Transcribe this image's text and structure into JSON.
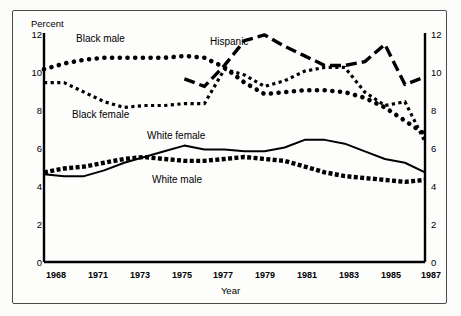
{
  "figure": {
    "y_axis_title": "Percent",
    "x_axis_title": "Year"
  },
  "chart_data": {
    "type": "line",
    "title": "",
    "subtitle": "",
    "xlabel": "Year",
    "ylabel": "Percent",
    "xlim": [
      1968,
      1987
    ],
    "ylim": [
      0,
      12
    ],
    "ytick_labels_left": [
      "12",
      "10",
      "8",
      "6",
      "4",
      "2",
      "0"
    ],
    "ytick_labels_right": [
      "12",
      "10",
      "8",
      "6",
      "4",
      "2",
      "0"
    ],
    "yticks": [
      12,
      10,
      8,
      6,
      4,
      2,
      0
    ],
    "xtick_labels": [
      "1968",
      "1971",
      "1973",
      "1975",
      "1977",
      "1979",
      "1981",
      "1983",
      "1985",
      "1987"
    ],
    "xticks": [
      1968,
      1971,
      1973,
      1975,
      1977,
      1979,
      1981,
      1983,
      1985,
      1987
    ],
    "grid": false,
    "legend_position": "inline-annotations",
    "x": [
      1968,
      1969,
      1970,
      1971,
      1972,
      1973,
      1974,
      1975,
      1976,
      1977,
      1978,
      1979,
      1980,
      1981,
      1982,
      1983,
      1984,
      1985,
      1986,
      1987
    ],
    "series": [
      {
        "name": "Black male",
        "style": "round-dotted",
        "label": "Black male",
        "x": [
          1968,
          1969,
          1970,
          1971,
          1972,
          1973,
          1974,
          1975,
          1976,
          1977,
          1978,
          1979,
          1980,
          1981,
          1982,
          1983,
          1984,
          1985,
          1986,
          1987
        ],
        "values": [
          10.1,
          10.4,
          10.6,
          10.7,
          10.7,
          10.7,
          10.7,
          10.8,
          10.7,
          10.2,
          9.4,
          8.8,
          8.9,
          9.0,
          9.0,
          8.9,
          8.6,
          8.1,
          7.4,
          6.7
        ],
        "values_right_tail": [
          6.5,
          6.3
        ]
      },
      {
        "name": "Black female",
        "style": "square-dotted",
        "label": "Black female",
        "x": [
          1968,
          1969,
          1970,
          1971,
          1972,
          1973,
          1974,
          1975,
          1976,
          1977,
          1978,
          1979,
          1980,
          1981,
          1982,
          1983,
          1984,
          1985,
          1986,
          1987
        ],
        "values": [
          9.4,
          9.4,
          8.9,
          8.4,
          8.1,
          8.2,
          8.2,
          8.3,
          8.3,
          10.1,
          9.8,
          9.2,
          9.5,
          10.0,
          10.2,
          10.2,
          8.9,
          8.2,
          8.4,
          6.3
        ],
        "values_tail": [
          6.2,
          6.4,
          6.6,
          6.8,
          7.0
        ]
      },
      {
        "name": "Hispanic",
        "style": "long-dash",
        "label": "Hispanic",
        "x": [
          1975,
          1976,
          1977,
          1978,
          1979,
          1980,
          1981,
          1982,
          1983,
          1984,
          1985,
          1986,
          1987
        ],
        "values": [
          9.6,
          9.2,
          10.3,
          11.6,
          11.9,
          11.3,
          10.8,
          10.3,
          10.3,
          10.5,
          11.4,
          9.3,
          9.7
        ]
      },
      {
        "name": "White female",
        "style": "solid",
        "label": "White female",
        "x": [
          1968,
          1969,
          1970,
          1971,
          1972,
          1973,
          1974,
          1975,
          1976,
          1977,
          1978,
          1979,
          1980,
          1981,
          1982,
          1983,
          1984,
          1985,
          1986,
          1987
        ],
        "values": [
          4.6,
          4.5,
          4.5,
          4.8,
          5.2,
          5.5,
          5.8,
          6.1,
          5.9,
          5.9,
          5.8,
          5.8,
          6.0,
          6.4,
          6.4,
          6.2,
          5.8,
          5.4,
          5.2,
          4.7
        ],
        "values_end": [
          4.8,
          5.0
        ]
      },
      {
        "name": "White male",
        "style": "block-dashed",
        "label": "White male",
        "x": [
          1968,
          1969,
          1970,
          1971,
          1972,
          1973,
          1974,
          1975,
          1976,
          1977,
          1978,
          1979,
          1980,
          1981,
          1982,
          1983,
          1984,
          1985,
          1986,
          1987
        ],
        "values": [
          4.7,
          4.9,
          5.0,
          5.2,
          5.4,
          5.5,
          5.4,
          5.3,
          5.3,
          5.4,
          5.5,
          5.4,
          5.3,
          5.0,
          4.7,
          4.5,
          4.4,
          4.3,
          4.2,
          4.3
        ],
        "values_end": [
          4.1,
          4.2
        ]
      }
    ],
    "annotations": [
      {
        "text": "Black male",
        "x": 1971.5,
        "y": 11.3
      },
      {
        "text": "Black female",
        "x": 1971.0,
        "y": 7.5
      },
      {
        "text": "Hispanic",
        "x": 1977.0,
        "y": 11.5
      },
      {
        "text": "White female",
        "x": 1975.5,
        "y": 6.6
      },
      {
        "text": "White male",
        "x": 1976.0,
        "y": 4.8
      }
    ]
  },
  "colors": {
    "ink": "#000000",
    "frame": "#4a4a4a",
    "background": "#fdfdfc"
  }
}
